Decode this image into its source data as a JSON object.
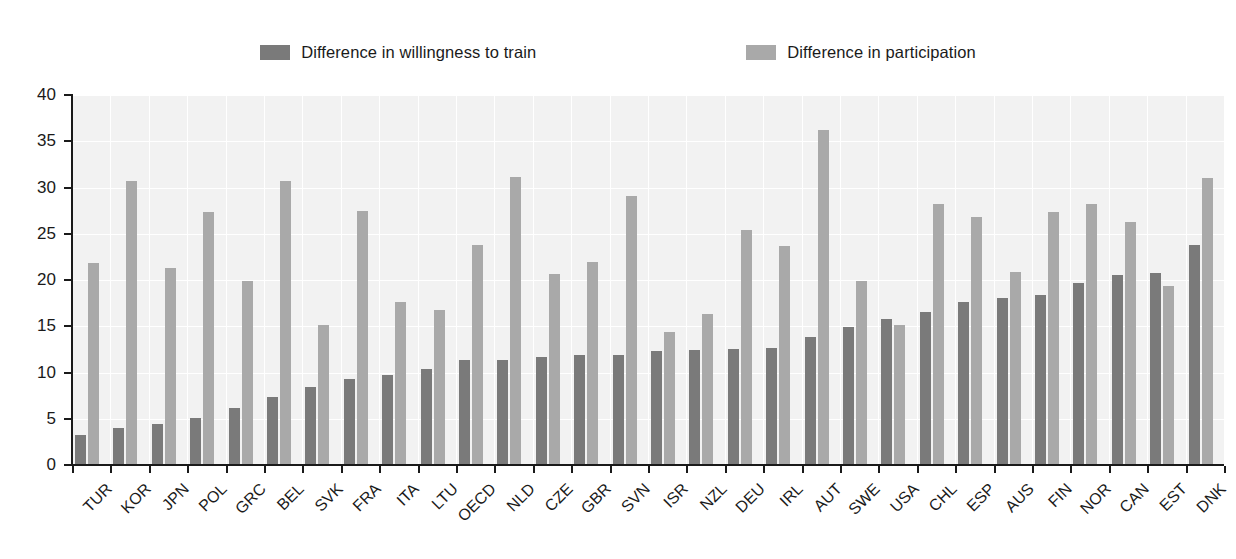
{
  "legend": {
    "items": [
      {
        "label": "Difference in willingness to train",
        "color": "#7a7a7a",
        "name": "legend-swatch-willingness"
      },
      {
        "label": "Difference in participation",
        "color": "#a9a9a9",
        "name": "legend-swatch-participation"
      }
    ]
  },
  "axis": {
    "y_ticks": [
      "0",
      "5",
      "10",
      "15",
      "20",
      "25",
      "30",
      "35",
      "40"
    ]
  },
  "colors": {
    "plot_background": "#f2f2f2",
    "gridline": "#ffffff",
    "axis": "#1a1a1a",
    "series_dark": "#7a7a7a",
    "series_light": "#a9a9a9"
  },
  "chart_data": {
    "type": "bar",
    "title": "",
    "subtitle": "",
    "xlabel": "",
    "ylabel": "",
    "ylim": [
      0,
      40
    ],
    "ytick_step": 5,
    "grid": true,
    "legend_position": "top-center",
    "categories": [
      "TUR",
      "KOR",
      "JPN",
      "POL",
      "GRC",
      "BEL",
      "SVK",
      "FRA",
      "ITA",
      "LTU",
      "OECD",
      "NLD",
      "CZE",
      "GBR",
      "SVN",
      "ISR",
      "NZL",
      "DEU",
      "IRL",
      "AUT",
      "SWE",
      "USA",
      "CHL",
      "ESP",
      "AUS",
      "FIN",
      "NOR",
      "CAN",
      "EST",
      "DNK"
    ],
    "series": [
      {
        "name": "Difference in willingness to train",
        "color": "#7a7a7a",
        "values": [
          3.2,
          4.0,
          4.4,
          5.1,
          6.2,
          7.3,
          8.4,
          9.3,
          9.7,
          10.4,
          11.3,
          11.4,
          11.7,
          11.9,
          11.9,
          12.3,
          12.4,
          12.5,
          12.6,
          13.8,
          14.9,
          15.8,
          16.5,
          17.6,
          18.1,
          18.4,
          19.7,
          20.5,
          20.8,
          23.8
        ]
      },
      {
        "name": "Difference in participation",
        "color": "#a9a9a9",
        "values": [
          21.8,
          30.7,
          21.3,
          27.3,
          19.9,
          30.7,
          15.1,
          27.5,
          17.6,
          16.8,
          23.8,
          31.1,
          20.7,
          21.9,
          29.1,
          14.4,
          16.3,
          25.4,
          23.7,
          36.2,
          19.9,
          15.1,
          28.2,
          26.8,
          20.9,
          27.3,
          28.2,
          26.3,
          19.4,
          31.0
        ]
      }
    ]
  }
}
